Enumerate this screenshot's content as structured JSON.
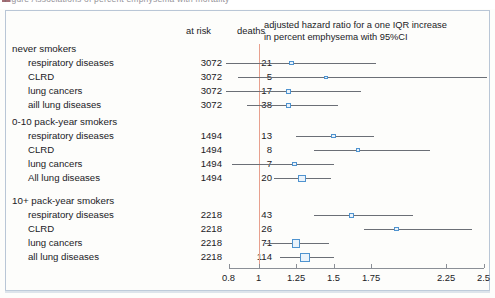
{
  "topstrip": {
    "text": "Figure     Associations of percent emphysema with mortality",
    "swatch_color": "#8d4a52"
  },
  "header": {
    "at_risk": "at risk",
    "deaths": "deaths",
    "plot_title_line1": "adjusted hazard ratio for a one IQR increase",
    "plot_title_line2": "in percent emphysema with 95%CI"
  },
  "colors": {
    "marker_stroke": "#4f93cf",
    "marker_fill": "#eaf3fb",
    "ci_line": "#6b6f76",
    "reference_line": "#e8a08e",
    "axis": "#8b8f96",
    "frame_border": "#b9c6d6",
    "background": "#fdfdfb",
    "text": "#1b1b1f"
  },
  "chart_data": {
    "type": "scatter",
    "plot_kind": "forest-plot",
    "xlabel": "",
    "ylabel": "",
    "xlim": [
      0.8,
      2.5
    ],
    "xscale": "linear",
    "grid": false,
    "legend": "none",
    "reference_value": 1,
    "tick_values": [
      0.8,
      1,
      1.25,
      1.5,
      1.75,
      2.25,
      2.5
    ],
    "tick_labels": [
      "0.8",
      "1",
      "1.25",
      "1.5",
      "1.75",
      "2.25",
      "2.5"
    ],
    "columns": [
      "outcome",
      "at risk",
      "deaths",
      "hazard ratio",
      "ci_low",
      "ci_high"
    ],
    "groups": [
      {
        "name": "never smokers",
        "rows": [
          {
            "outcome": "respiratory diseases",
            "at_risk": "3072",
            "deaths": "21",
            "hr": 1.22,
            "ci_low": 0.78,
            "ci_high": 1.78,
            "marker": 4.2
          },
          {
            "outcome": "CLRD",
            "at_risk": "3072",
            "deaths": "5",
            "hr": 1.45,
            "ci_low": 0.86,
            "ci_high": 2.62,
            "marker": 3.4
          },
          {
            "outcome": "lung cancers",
            "at_risk": "3072",
            "deaths": "17",
            "hr": 1.2,
            "ci_low": 0.78,
            "ci_high": 1.68,
            "marker": 4.6
          },
          {
            "outcome": "aill lung diseases",
            "at_risk": "3072",
            "deaths": "38",
            "hr": 1.2,
            "ci_low": 0.92,
            "ci_high": 1.53,
            "marker": 4.8
          }
        ]
      },
      {
        "name": "0-10 pack-year smokers",
        "rows": [
          {
            "outcome": "respiratory diseases",
            "at_risk": "1494",
            "deaths": "13",
            "hr": 1.5,
            "ci_low": 1.25,
            "ci_high": 1.77,
            "marker": 4.6
          },
          {
            "outcome": "CLRD",
            "at_risk": "1494",
            "deaths": "8",
            "hr": 1.66,
            "ci_low": 1.37,
            "ci_high": 2.14,
            "marker": 4.0
          },
          {
            "outcome": "lung cancers",
            "at_risk": "1494",
            "deaths": "7",
            "hr": 1.24,
            "ci_low": 0.82,
            "ci_high": 1.5,
            "marker": 4.4
          },
          {
            "outcome": "All lung diseases",
            "at_risk": "1494",
            "deaths": "20",
            "hr": 1.29,
            "ci_low": 1.1,
            "ci_high": 1.48,
            "marker": 7.6
          }
        ]
      },
      {
        "name": "10+ pack-year smokers",
        "rows": [
          {
            "outcome": "respiratory diseases",
            "at_risk": "2218",
            "deaths": "43",
            "hr": 1.62,
            "ci_low": 1.37,
            "ci_high": 2.03,
            "marker": 5.2
          },
          {
            "outcome": "CLRD",
            "at_risk": "2218",
            "deaths": "26",
            "hr": 1.92,
            "ci_low": 1.7,
            "ci_high": 2.42,
            "marker": 4.2
          },
          {
            "outcome": "lung cancers",
            "at_risk": "2218",
            "deaths": "71",
            "hr": 1.25,
            "ci_low": 1.04,
            "ci_high": 1.47,
            "marker": 8.6
          },
          {
            "outcome": "all lung diseases",
            "at_risk": "2218",
            "deaths": "114",
            "hr": 1.31,
            "ci_low": 1.14,
            "ci_high": 1.5,
            "marker": 9.8
          }
        ]
      }
    ]
  }
}
